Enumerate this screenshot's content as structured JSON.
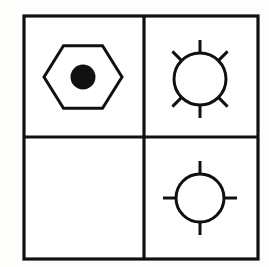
{
  "figure": {
    "kind": "matrix-reasoning-puzzle",
    "rows": 2,
    "columns": 4,
    "background_color": "#fdfdfb",
    "ink_color": "#111111",
    "frame": {
      "x": 24,
      "y": 16,
      "width": 234,
      "height": 243,
      "stroke_width": 3.2
    },
    "dividers": {
      "vertical_x": 144,
      "horizontal_y": 137,
      "stroke_width": 3.2
    }
  },
  "cells": [
    {
      "id": "cell-top-left",
      "position": "top-left",
      "row": 1,
      "column": 1,
      "empty": false,
      "shape_label": "hexagon-with-filled-dot",
      "description": "Flat-top hexagon outline containing a solid black circle at its center",
      "outer": {
        "shape": "hexagon",
        "orientation": "flat-top",
        "center_x": 83,
        "center_y": 77,
        "radius_x": 39,
        "radius_y": 36,
        "filled": false,
        "stroke_width": 3.0
      },
      "inner": {
        "shape": "circle",
        "center_x": 83,
        "center_y": 77,
        "radius": 12.5,
        "filled": true
      },
      "rays": 0
    },
    {
      "id": "cell-top-right",
      "position": "top-right",
      "row": 1,
      "column": 2,
      "empty": false,
      "shape_label": "circle-with-six-rays",
      "description": "Circle outline with six radiating spokes: vertical top, vertical bottom, and four diagonals",
      "outer": {
        "shape": "circle",
        "center_x": 200,
        "center_y": 79,
        "radius": 26,
        "filled": false,
        "stroke_width": 3.0
      },
      "inner": null,
      "rays": 6,
      "ray_angles_degrees": [
        90,
        45,
        315,
        270,
        225,
        135
      ],
      "ray_length": 13
    },
    {
      "id": "cell-bottom-left",
      "position": "bottom-left",
      "row": 2,
      "column": 1,
      "empty": true,
      "shape_label": "blank-missing-cell",
      "description": "Empty cell - the missing element of the matrix",
      "outer": null,
      "inner": null,
      "rays": 0
    },
    {
      "id": "cell-bottom-right",
      "position": "bottom-right",
      "row": 2,
      "column": 2,
      "empty": false,
      "shape_label": "circle-with-four-rays",
      "description": "Circle outline with four cardinal spokes forming a crosshair",
      "outer": {
        "shape": "circle",
        "center_x": 200,
        "center_y": 198,
        "radius": 24,
        "filled": false,
        "stroke_width": 3.0
      },
      "inner": null,
      "rays": 4,
      "ray_angles_degrees": [
        90,
        0,
        270,
        180
      ],
      "ray_length": 13
    }
  ]
}
